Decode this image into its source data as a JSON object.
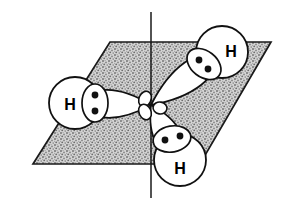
{
  "figure": {
    "molecule": "NH3",
    "central_atom_label": "N",
    "background_color": "#ffffff",
    "ink_color": "#111111",
    "plane_fill_color": "#bfbfbf",
    "plane_stipple_color": "#7a7a7a",
    "orbital_fill_color": "#ffffff",
    "electron_dot_color": "#111111"
  },
  "plane": {
    "name": "reference-plane",
    "shape": "parallelogram",
    "corners": [
      {
        "x": 110,
        "y": 42
      },
      {
        "x": 271,
        "y": 42
      },
      {
        "x": 200,
        "y": 164
      },
      {
        "x": 33,
        "y": 164
      }
    ],
    "outline_color": "#1a1a1a",
    "fill_style": "stipple"
  },
  "axis": {
    "name": "vertical-symmetry-axis",
    "x": 151,
    "y_top": 12,
    "y_bottom": 198,
    "color": "#1a1a1a"
  },
  "center": {
    "name": "nitrogen-center",
    "x": 151,
    "y": 105
  },
  "hydrogens": [
    {
      "id": "left",
      "label": "H",
      "circle": {
        "cx": 75,
        "cy": 103,
        "r": 26
      },
      "label_pos": {
        "x": 70,
        "y": 104
      },
      "pair_ellipse": {
        "cx": 95,
        "cy": 103,
        "rx": 13,
        "ry": 19,
        "rotate": 0
      },
      "dots": [
        {
          "x": 95,
          "y": 95
        },
        {
          "x": 95,
          "y": 111
        }
      ],
      "lobe_tip": {
        "x": 151,
        "y": 105
      },
      "lobe_wide_half_width": 20
    },
    {
      "id": "upper-right",
      "label": "H",
      "circle": {
        "cx": 222,
        "cy": 52,
        "r": 26
      },
      "label_pos": {
        "x": 231,
        "y": 51
      },
      "pair_ellipse": {
        "cx": 204,
        "cy": 64,
        "rx": 19,
        "ry": 13,
        "rotate": 38
      },
      "dots": [
        {
          "x": 199,
          "y": 60
        },
        {
          "x": 208,
          "y": 69
        }
      ],
      "lobe_tip": {
        "x": 151,
        "y": 105
      },
      "lobe_wide_half_width": 20
    },
    {
      "id": "lower-middle",
      "label": "H",
      "circle": {
        "cx": 180,
        "cy": 160,
        "r": 26
      },
      "label_pos": {
        "x": 180,
        "y": 168
      },
      "pair_ellipse": {
        "cx": 172,
        "cy": 139,
        "rx": 19,
        "ry": 13,
        "rotate": -10
      },
      "dots": [
        {
          "x": 165,
          "y": 140
        },
        {
          "x": 180,
          "y": 136
        }
      ],
      "lobe_tip": {
        "x": 151,
        "y": 105
      },
      "lobe_wide_half_width": 19
    }
  ],
  "back_lobes": [
    {
      "id": "back-lobe-a",
      "cx": 145,
      "cy": 99,
      "rx": 6,
      "ry": 8,
      "rotate": 25
    },
    {
      "id": "back-lobe-b",
      "cx": 145,
      "cy": 112,
      "rx": 6,
      "ry": 8,
      "rotate": -25
    },
    {
      "id": "back-lobe-c",
      "cx": 160,
      "cy": 108,
      "rx": 7,
      "ry": 6,
      "rotate": 10
    }
  ]
}
